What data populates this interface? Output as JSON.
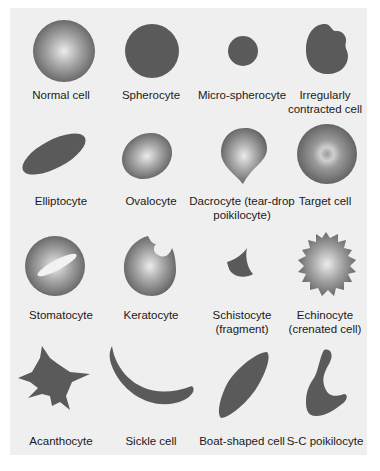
{
  "figure": {
    "colors": {
      "panel_bg": "#efefef",
      "cell_dark": "#5a5a5a",
      "cell_light": "#e8e8e8"
    },
    "rows": [
      [
        {
          "id": "normal",
          "label": "Normal cell",
          "shape": "shaded-disc"
        },
        {
          "id": "spherocyte",
          "label": "Spherocyte",
          "shape": "solid-disc"
        },
        {
          "id": "micro",
          "label": "Micro-spherocyte",
          "shape": "small-solid-disc"
        },
        {
          "id": "irregular",
          "label": "Irregularly contracted cell",
          "shape": "solid-irregular"
        }
      ],
      [
        {
          "id": "elliptocyte",
          "label": "Elliptocyte",
          "shape": "solid-ellipse"
        },
        {
          "id": "ovalocyte",
          "label": "Ovalocyte",
          "shape": "shaded-oval"
        },
        {
          "id": "dacrocyte",
          "label": "Dacrocyte (tear-drop poikilocyte)",
          "shape": "shaded-teardrop"
        },
        {
          "id": "target",
          "label": "Target cell",
          "shape": "target-disc"
        }
      ],
      [
        {
          "id": "stomatocyte",
          "label": "Stomatocyte",
          "shape": "shaded-disc-slit"
        },
        {
          "id": "keratocyte",
          "label": "Keratocyte",
          "shape": "shaded-bitten"
        },
        {
          "id": "schistocyte",
          "label": "Schistocyte (fragment)",
          "shape": "solid-fragment"
        },
        {
          "id": "echinocyte",
          "label": "Echinocyte (crenated cell)",
          "shape": "shaded-crenated"
        }
      ],
      [
        {
          "id": "acanthocyte",
          "label": "Acanthocyte",
          "shape": "solid-spiky"
        },
        {
          "id": "sickle",
          "label": "Sickle cell",
          "shape": "solid-crescent"
        },
        {
          "id": "boat",
          "label": "Boat-shaped cell",
          "shape": "solid-boat"
        },
        {
          "id": "sc",
          "label": "S-C poikilocyte",
          "shape": "solid-sc"
        }
      ]
    ]
  }
}
